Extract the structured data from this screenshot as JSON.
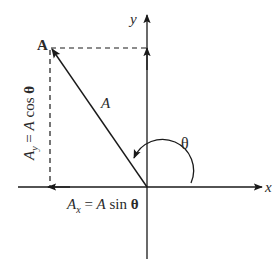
{
  "diagram": {
    "type": "vector-components",
    "axes": {
      "x_label": "x",
      "y_label": "y"
    },
    "point_label": "A",
    "vector_label": "A",
    "angle_label": "θ",
    "component_y": {
      "symbol": "A",
      "subscript": "y",
      "equals": " = ",
      "magnitude": "A",
      "func": " cos ",
      "angle": "θ"
    },
    "component_x": {
      "symbol": "A",
      "subscript": "x",
      "equals": " = ",
      "magnitude": "A",
      "func": " sin ",
      "angle": "θ"
    },
    "colors": {
      "line": "#1a1a1a",
      "text": "#2a2a2a",
      "background": "#ffffff"
    }
  }
}
